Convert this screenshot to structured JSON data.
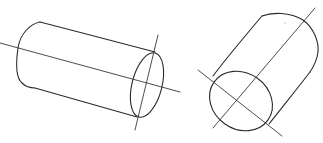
{
  "figure": {
    "stroke_color": "#2a2a2a",
    "background_color": "#ffffff",
    "shapes": [
      {
        "name": "cylinder-horizontal",
        "orientation": "lying, tilted down to the right",
        "has_axis_lines": 2
      },
      {
        "name": "cylinder-tilted",
        "orientation": "standing, tilted up to the right",
        "has_axis_lines": 2
      }
    ]
  }
}
